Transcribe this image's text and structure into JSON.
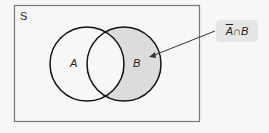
{
  "diagram": {
    "universe_label": "S",
    "set_a_label": "A",
    "set_b_label": "B",
    "callout": {
      "complement": "A",
      "operator": "∩",
      "set": "B"
    },
    "colors": {
      "shade": "#dcdcdc",
      "stroke": "#111111",
      "box": "#777777",
      "callout_bg": "#e6e6e6"
    }
  }
}
